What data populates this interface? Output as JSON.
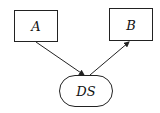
{
  "diagram": {
    "nodes": [
      {
        "id": "A",
        "label": "A",
        "shape": "rectangle"
      },
      {
        "id": "B",
        "label": "B",
        "shape": "rectangle"
      },
      {
        "id": "DS",
        "label": "DS",
        "shape": "ellipse"
      }
    ],
    "edges": [
      {
        "from": "A",
        "to": "DS"
      },
      {
        "from": "DS",
        "to": "B"
      }
    ],
    "colors": {
      "stroke": "#222222",
      "background": "#ffffff",
      "text": "#111111"
    }
  }
}
